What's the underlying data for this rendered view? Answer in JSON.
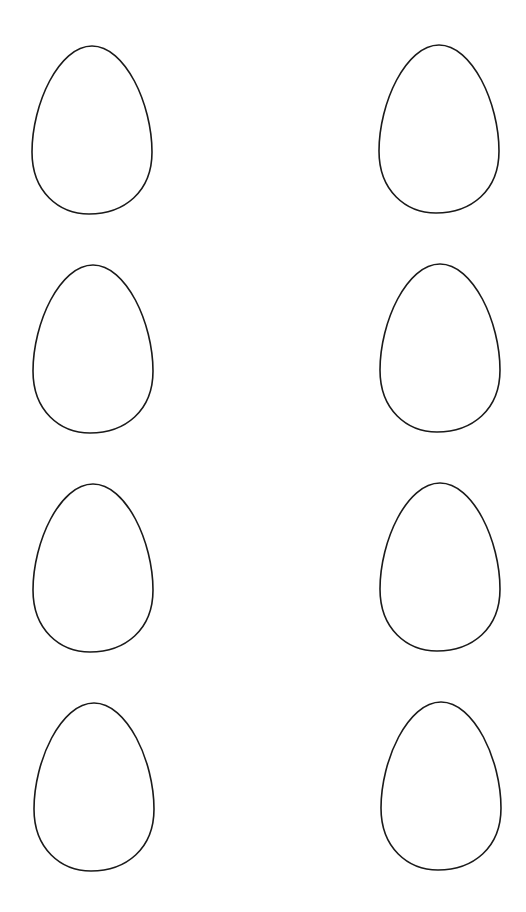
{
  "page": {
    "title": "",
    "background": "#ffffff",
    "outline_color": "#1a1a1a"
  },
  "eggs": [
    {
      "id": "egg-1",
      "row": 1,
      "col": "left",
      "left": 29,
      "top": 44
    },
    {
      "id": "egg-2",
      "row": 1,
      "col": "right",
      "left": 376,
      "top": 43
    },
    {
      "id": "egg-3",
      "row": 2,
      "col": "left",
      "left": 30,
      "top": 263
    },
    {
      "id": "egg-4",
      "row": 2,
      "col": "right",
      "left": 377,
      "top": 262
    },
    {
      "id": "egg-5",
      "row": 3,
      "col": "left",
      "left": 30,
      "top": 482
    },
    {
      "id": "egg-6",
      "row": 3,
      "col": "right",
      "left": 377,
      "top": 481
    },
    {
      "id": "egg-7",
      "row": 4,
      "col": "left",
      "left": 31,
      "top": 701
    },
    {
      "id": "egg-8",
      "row": 4,
      "col": "right",
      "left": 378,
      "top": 700
    }
  ]
}
